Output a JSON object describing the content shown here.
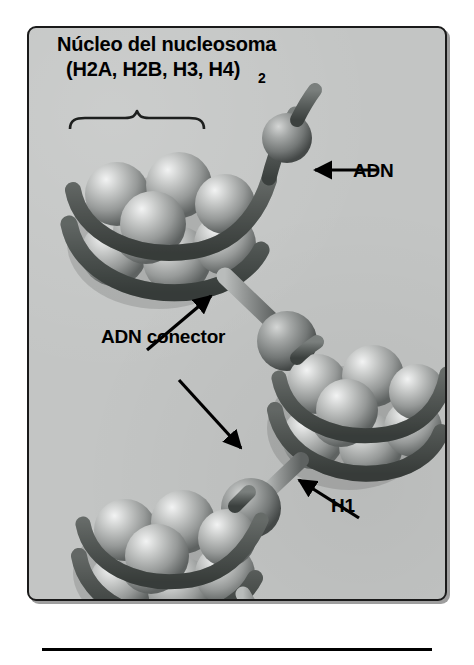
{
  "figure": {
    "language": "es",
    "background_color": "#ffffff",
    "panel_color": "#c3c5c4",
    "border_color": "#1a1a1a",
    "sphere_color": "#9a9c9b",
    "sphere_highlight": "#e8e9e9",
    "dna_ribbon_color": "#5f6462",
    "linker_color": "#8d908f",
    "arrow_color": "#000000"
  },
  "title": {
    "line1": "Núcleo del nucleosoma",
    "line2": "(H2A, H2B, H3, H4)",
    "subscript": "2"
  },
  "labels": {
    "dna": "ADN",
    "linker_dna": "ADN conector",
    "histone_h1": "H1"
  },
  "annotations": [
    {
      "name": "dna-arrow",
      "label": "ADN",
      "direction": "left",
      "points_to": "dna-ribbon-top-nucleosome"
    },
    {
      "name": "linker-arrow-upper",
      "label": "ADN conector",
      "direction": "up-right",
      "points_to": "linker-dna-rod-upper"
    },
    {
      "name": "linker-arrow-lower",
      "label": "ADN conector",
      "direction": "down-right",
      "points_to": "linker-dna-rod-lower"
    },
    {
      "name": "h1-arrow",
      "label": "H1",
      "direction": "up-left",
      "points_to": "h1-histone-sphere"
    }
  ],
  "structures": {
    "brace": {
      "name": "core-particle-brace",
      "spans": "first-nucleosome-core"
    },
    "nucleosomes": [
      {
        "name": "nucleosome-top",
        "dna_turns": 2
      },
      {
        "name": "nucleosome-middle",
        "dna_turns": 2
      },
      {
        "name": "nucleosome-bottom",
        "dna_turns": 2
      }
    ],
    "h1_spheres": [
      {
        "name": "h1-sphere-upper"
      },
      {
        "name": "h1-sphere-lower"
      }
    ]
  },
  "footer": {
    "rule": "horizontal-divider"
  }
}
